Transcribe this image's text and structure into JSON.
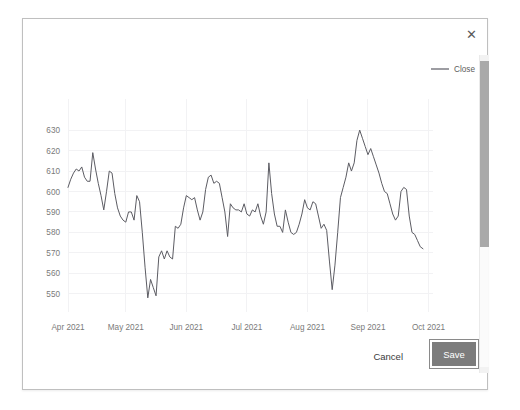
{
  "dialog": {
    "close_icon": "close-icon",
    "close_glyph": "✕"
  },
  "footer": {
    "cancel_label": "Cancel",
    "save_label": "Save"
  },
  "scrollbar": {
    "orientation": "vertical",
    "thumb_name": "scrollbar-thumb"
  },
  "colors": {
    "series_line": "#5c5c63",
    "grid": "#f2f2f4",
    "tick_text": "#7a7a7a",
    "save_button_bg": "#7c7c7c",
    "dialog_border": "#bfbfbf"
  },
  "chart_data": {
    "type": "line",
    "title": "",
    "xlabel": "",
    "ylabel": "",
    "ylim": [
      545,
      633
    ],
    "yticks": [
      550,
      560,
      570,
      580,
      590,
      600,
      610,
      620,
      630
    ],
    "ytick_labels": [
      "550",
      "560",
      "570",
      "580",
      "590",
      "600",
      "610",
      "620",
      "630"
    ],
    "xticks": [
      "Apr 2021",
      "May 2021",
      "Jun 2021",
      "Jul 2021",
      "Aug 2021",
      "Sep 2021",
      "Oct 2021"
    ],
    "xtick_positions": [
      0,
      21,
      43,
      65,
      87,
      109,
      131
    ],
    "grid": true,
    "legend": {
      "position": "top-right",
      "entries": [
        "Close"
      ]
    },
    "series": [
      {
        "name": "Close",
        "color": "#5c5c63",
        "values": [
          602,
          606,
          609,
          611,
          610,
          612,
          607,
          605,
          605,
          619,
          611,
          604,
          598,
          591,
          600,
          610,
          609,
          599,
          592,
          588,
          586,
          585,
          590,
          590,
          586,
          598,
          595,
          580,
          563,
          548,
          557,
          553,
          549,
          568,
          571,
          567,
          571,
          568,
          567,
          583,
          582,
          584,
          592,
          598,
          597,
          596,
          597,
          591,
          586,
          590,
          601,
          607,
          608,
          604,
          605,
          604,
          597,
          590,
          578,
          594,
          592,
          591,
          591,
          590,
          594,
          589,
          588,
          591,
          590,
          594,
          588,
          584,
          590,
          614,
          599,
          589,
          583,
          583,
          580,
          591,
          585,
          580,
          579,
          580,
          584,
          589,
          596,
          592,
          591,
          595,
          594,
          588,
          582,
          584,
          581,
          566,
          552,
          564,
          580,
          597,
          602,
          607,
          614,
          610,
          614,
          625,
          630,
          626,
          622,
          618,
          621,
          617,
          613,
          609,
          604,
          600,
          599,
          594,
          589,
          586,
          588,
          600,
          602,
          601,
          588,
          580,
          579,
          576,
          573,
          572
        ]
      }
    ]
  }
}
